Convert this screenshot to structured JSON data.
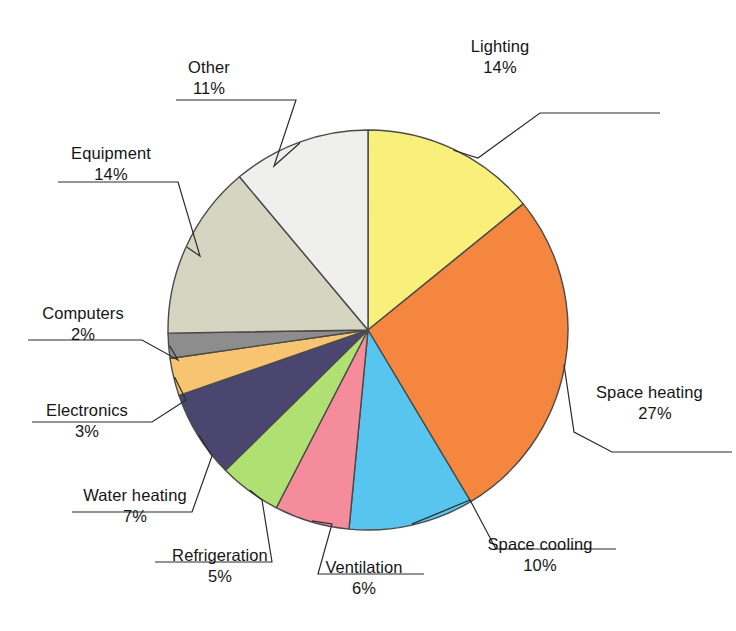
{
  "chart_data": {
    "type": "pie",
    "title": "",
    "subtitle": "",
    "legend_position": "callout-labels",
    "units": "percent",
    "total": 99,
    "categories": [
      "Lighting",
      "Space heating",
      "Space cooling",
      "Ventilation",
      "Refrigeration",
      "Water heating",
      "Electronics",
      "Computers",
      "Equipment",
      "Other"
    ],
    "values": [
      14,
      27,
      10,
      6,
      5,
      7,
      3,
      2,
      14,
      11
    ],
    "colors": [
      "#f9ef7b",
      "#f5863f",
      "#58c5ee",
      "#f58c9c",
      "#afe071",
      "#4b4670",
      "#f7c571",
      "#8d8d8d",
      "#d5d5c1",
      "#efefed"
    ],
    "slices": [
      {
        "label": "Lighting",
        "value": 14,
        "value_text": "14%",
        "color": "#f9ef7b"
      },
      {
        "label": "Space heating",
        "value": 27,
        "value_text": "27%",
        "color": "#f5863f"
      },
      {
        "label": "Space cooling",
        "value": 10,
        "value_text": "10%",
        "color": "#58c5ee"
      },
      {
        "label": "Ventilation",
        "value": 6,
        "value_text": "6%",
        "color": "#f58c9c"
      },
      {
        "label": "Refrigeration",
        "value": 5,
        "value_text": "5%",
        "color": "#afe071"
      },
      {
        "label": "Water heating",
        "value": 7,
        "value_text": "7%",
        "color": "#4b4670"
      },
      {
        "label": "Electronics",
        "value": 3,
        "value_text": "3%",
        "color": "#f7c571"
      },
      {
        "label": "Computers",
        "value": 2,
        "value_text": "2%",
        "color": "#8d8d8d"
      },
      {
        "label": "Equipment",
        "value": 14,
        "value_text": "14%",
        "color": "#d5d5c1"
      },
      {
        "label": "Other",
        "value": 11,
        "value_text": "11%",
        "color": "#efefed"
      }
    ],
    "start_angle_deg": 0,
    "direction": "clockwise",
    "grid": false
  },
  "labels": [
    {
      "name": "Lighting",
      "pct": "14%"
    },
    {
      "name": "Space heating",
      "pct": "27%"
    },
    {
      "name": "Space cooling",
      "pct": "10%"
    },
    {
      "name": "Ventilation",
      "pct": "6%"
    },
    {
      "name": "Refrigeration",
      "pct": "5%"
    },
    {
      "name": "Water heating",
      "pct": "7%"
    },
    {
      "name": "Electronics",
      "pct": "3%"
    },
    {
      "name": "Computers",
      "pct": "2%"
    },
    {
      "name": "Equipment",
      "pct": "14%"
    },
    {
      "name": "Other",
      "pct": "11%"
    }
  ],
  "style": {
    "slice_outline": "#4a4a4a",
    "leader_line": "#2b2b2b",
    "background": "#ffffff"
  }
}
